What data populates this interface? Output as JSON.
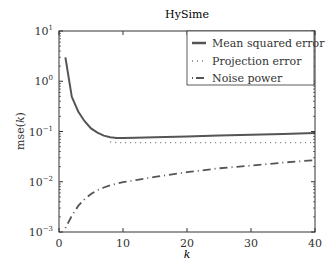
{
  "chart_data": {
    "type": "line",
    "title": "HySime",
    "xlabel": "k",
    "ylabel": "mse(k)",
    "yscale": "log",
    "xlim": [
      0,
      40
    ],
    "ylim": [
      0.001,
      10
    ],
    "xticks": [
      0,
      10,
      20,
      30,
      40
    ],
    "yticks": [
      "10^-3",
      "10^-2",
      "10^-1",
      "10^0",
      "10^1"
    ],
    "grid": false,
    "legend_position": "upper right",
    "x": [
      1,
      2,
      3,
      4,
      5,
      6,
      7,
      8,
      9,
      10,
      12,
      15,
      20,
      25,
      30,
      35,
      40
    ],
    "series": [
      {
        "name": "Mean squared error",
        "style": "solid",
        "values": [
          3.0,
          0.49,
          0.25,
          0.16,
          0.115,
          0.095,
          0.083,
          0.077,
          0.074,
          0.074,
          0.075,
          0.077,
          0.08,
          0.083,
          0.086,
          0.089,
          0.093
        ]
      },
      {
        "name": "Projection error",
        "style": "dotted",
        "values": [
          null,
          null,
          null,
          null,
          null,
          null,
          null,
          0.062,
          0.06,
          0.06,
          0.06,
          0.06,
          0.06,
          0.06,
          0.06,
          0.06,
          0.06
        ]
      },
      {
        "name": "Noise power",
        "style": "dashdot",
        "values": [
          0.0012,
          0.0021,
          0.0033,
          0.0045,
          0.0057,
          0.0068,
          0.0077,
          0.0085,
          0.0092,
          0.0098,
          0.0108,
          0.0125,
          0.0155,
          0.0185,
          0.021,
          0.024,
          0.027
        ]
      }
    ]
  },
  "labels": {
    "title": "HySime",
    "xlabel": "k",
    "ylabel_prefix": "mse(",
    "ylabel_var": "k",
    "ylabel_suffix": ")",
    "legend": [
      "Mean squared error",
      "Projection error",
      "Noise power"
    ]
  }
}
